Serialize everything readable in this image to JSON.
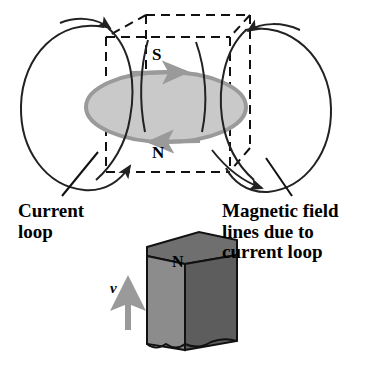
{
  "figure": {
    "diagram_labels": {
      "loop_south_pole": "S",
      "loop_north_pole": "N",
      "magnet_pole": "N",
      "velocity_symbol": "v"
    },
    "callouts": {
      "current_loop": "Current\nloop",
      "magnetic_field_lines": "Magnetic field\nlines due to\ncurrent loop"
    },
    "colors": {
      "ink": "#000000",
      "loop_fill": "#c9c9c9",
      "loop_stroke": "#9a9a9a",
      "magnet_front": "#8c8c8c",
      "magnet_top": "#6f6f6f",
      "magnet_side": "#5d5d5d",
      "velocity_arrow": "#9a9a9a",
      "field_line": "#222222",
      "background": "#ffffff"
    },
    "elements": {
      "current_loop_name": "grey shaded ellipse representing the current loop",
      "field_lines_name": "closed oval magnetic field lines on left and right",
      "dashed_box_name": "dashed rectangular prism around the loop",
      "bar_magnet_name": "grey 3D bar magnet labelled N moving upward"
    }
  }
}
